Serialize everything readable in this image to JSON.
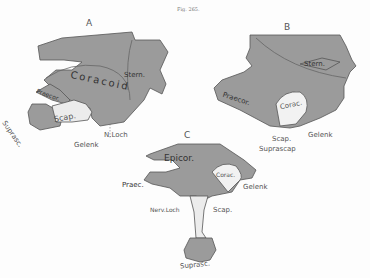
{
  "caption": "Fig. 265.",
  "colors": {
    "bone_fill": "#9b9b9b",
    "outline": "#555555",
    "cartilage": "#f2f2f2",
    "paper": "#fdfdfd"
  },
  "panels": {
    "A": {
      "letter": "A",
      "labels": {
        "coracoid": "Coracoid",
        "stern": "Stern.",
        "praecor": "Praecor.",
        "scap": "Scap.",
        "suprasc": "Suprasc.",
        "gelenk": "Gelenk",
        "n_loch": "N.Loch"
      }
    },
    "B": {
      "letter": "B",
      "labels": {
        "stern": "Stern.",
        "praecor": "Praecor.",
        "corac": "Corac.",
        "scap": "Scap.",
        "gelenk": "Gelenk",
        "suprascap": "Suprascap"
      }
    },
    "C": {
      "letter": "C",
      "labels": {
        "epicor": "Epicor.",
        "praec": "Praec.",
        "corac": "Corac.",
        "gelenk": "Gelenk",
        "nerv_loch": "Nerv.Loch",
        "scap": "Scap.",
        "suprasc": "Suprasc."
      }
    }
  }
}
